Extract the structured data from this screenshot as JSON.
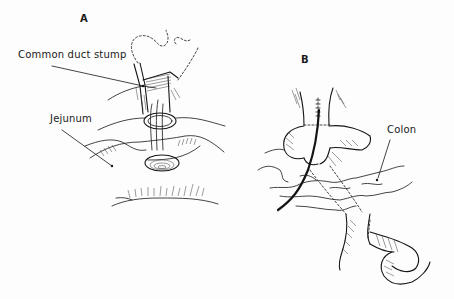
{
  "figure": {
    "panels": [
      {
        "id": "A",
        "letter": "A",
        "labels": [
          {
            "text": "Common duct stump"
          },
          {
            "text": "Jejunum"
          }
        ]
      },
      {
        "id": "B",
        "letter": "B",
        "labels": [
          {
            "text": "Colon"
          }
        ]
      }
    ],
    "colors": {
      "ink": "#151515",
      "background": "#fdfdfd"
    }
  }
}
